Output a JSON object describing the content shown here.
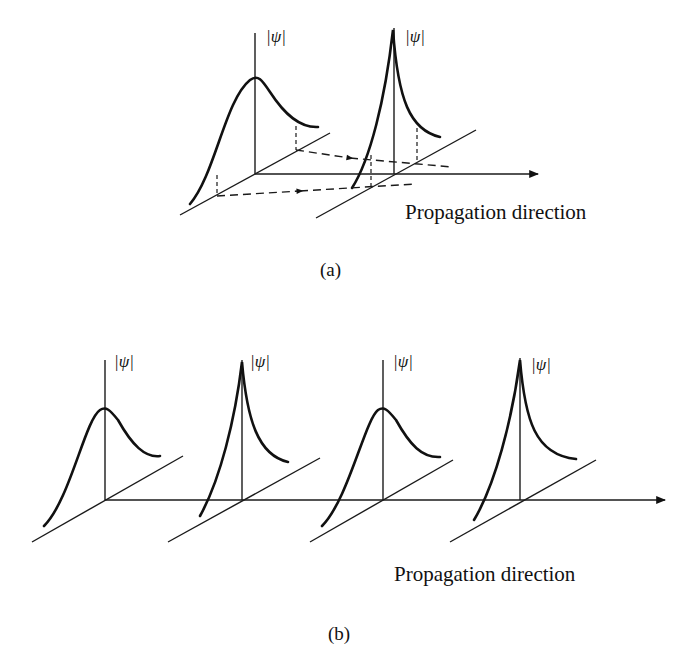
{
  "figure_a": {
    "caption": "(a)",
    "axis_label": "Propagation direction",
    "pulses": [
      {
        "label": "|ψ|",
        "shape": "broad"
      },
      {
        "label": "|ψ|",
        "shape": "sharp"
      }
    ]
  },
  "figure_b": {
    "caption": "(b)",
    "axis_label": "Propagation direction",
    "pulses": [
      {
        "label": "|ψ|",
        "shape": "broad"
      },
      {
        "label": "|ψ|",
        "shape": "sharp"
      },
      {
        "label": "|ψ|",
        "shape": "broad"
      },
      {
        "label": "|ψ|",
        "shape": "sharp"
      }
    ]
  }
}
